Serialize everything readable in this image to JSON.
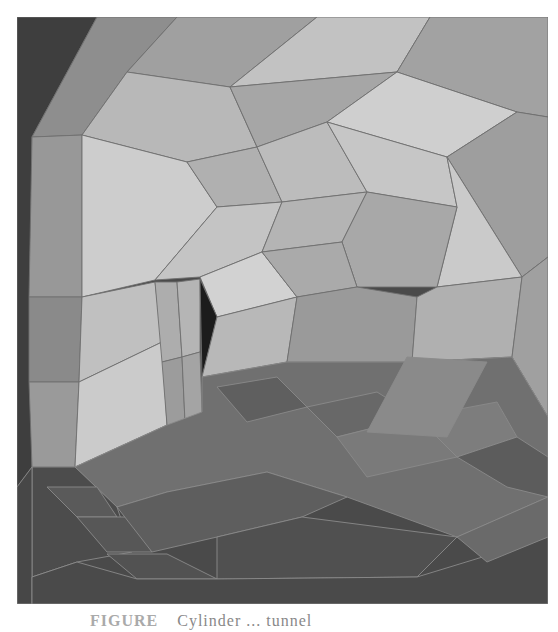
{
  "figure": {
    "colors": {
      "background_dark": "#3e3e3e",
      "wall_light": "#c8c8c8",
      "wall_mid": "#a8a8a8",
      "wall_dark": "#8c8c8c",
      "floor_mid": "#6c6c6c",
      "floor_dark": "#555555",
      "hole": "#1c1c1c",
      "edge": "#6f6f6f"
    }
  },
  "caption": {
    "label": "FIGURE",
    "text": "Cylinder ... tunnel"
  }
}
